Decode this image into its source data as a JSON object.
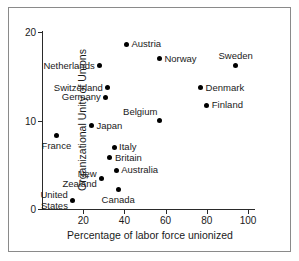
{
  "chart_data": {
    "type": "scatter",
    "title": "",
    "xlabel": "Percentage of labor force unionized",
    "ylabel": "Organizational Unity of Unions",
    "xlim": [
      0,
      103
    ],
    "ylim": [
      0,
      20
    ],
    "xticks": [
      20,
      40,
      60,
      80,
      100
    ],
    "yticks": [
      0,
      10,
      20
    ],
    "grid": false,
    "legend": null,
    "points": [
      {
        "label": "Austria",
        "x": 41,
        "y": 18.6,
        "label_pos": "right"
      },
      {
        "label": "Norway",
        "x": 57,
        "y": 17.0,
        "label_pos": "right"
      },
      {
        "label": "Sweden",
        "x": 94,
        "y": 16.2,
        "label_pos": "above"
      },
      {
        "label": "Netherlands",
        "x": 28,
        "y": 16.2,
        "label_pos": "left"
      },
      {
        "label": "Switzerland",
        "x": 32,
        "y": 13.7,
        "label_pos": "left"
      },
      {
        "label": "Denmark",
        "x": 77,
        "y": 13.7,
        "label_pos": "right"
      },
      {
        "label": "Germany",
        "x": 31,
        "y": 12.6,
        "label_pos": "left"
      },
      {
        "label": "Finland",
        "x": 80,
        "y": 11.7,
        "label_pos": "right"
      },
      {
        "label": "Belgium",
        "x": 57,
        "y": 10.0,
        "label_pos": "above-left"
      },
      {
        "label": "Japan",
        "x": 24,
        "y": 9.4,
        "label_pos": "right"
      },
      {
        "label": "France",
        "x": 7,
        "y": 8.3,
        "label_pos": "below"
      },
      {
        "label": "Italy",
        "x": 35,
        "y": 7.0,
        "label_pos": "right"
      },
      {
        "label": "Britain",
        "x": 33,
        "y": 5.8,
        "label_pos": "right"
      },
      {
        "label": "Australia",
        "x": 36,
        "y": 4.4,
        "label_pos": "right"
      },
      {
        "label": "New\nZealand",
        "x": 29,
        "y": 3.4,
        "label_pos": "left-multi"
      },
      {
        "label": "Canada",
        "x": 37,
        "y": 2.2,
        "label_pos": "below"
      },
      {
        "label": "United\nStates",
        "x": 15,
        "y": 1.0,
        "label_pos": "left-multi"
      }
    ]
  },
  "style": {
    "marker_color": "#000000",
    "axis_color": "#2a2a2a",
    "text_color": "#1a1a1a",
    "frame_color": "#8a8a8a",
    "background": "#ffffff"
  }
}
